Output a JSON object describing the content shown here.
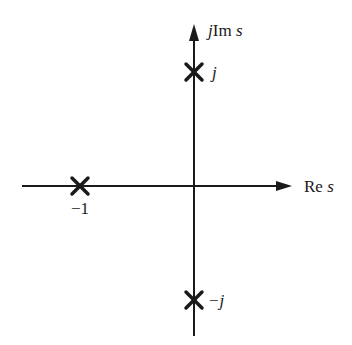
{
  "diagram": {
    "axes": {
      "imag_label_prefix": "j",
      "imag_label_main": "Im ",
      "imag_label_var": "s",
      "real_label_main": "Re ",
      "real_label_var": "s"
    },
    "poles": [
      {
        "label": "−1",
        "re": -1,
        "im": 0,
        "marker": "x"
      },
      {
        "label": "j",
        "re": 0,
        "im": 1,
        "marker": "x"
      },
      {
        "label": "−j",
        "re": 0,
        "im": -1,
        "marker": "x"
      }
    ],
    "colors": {
      "ink": "#1a1a1a",
      "background": "#ffffff"
    }
  }
}
